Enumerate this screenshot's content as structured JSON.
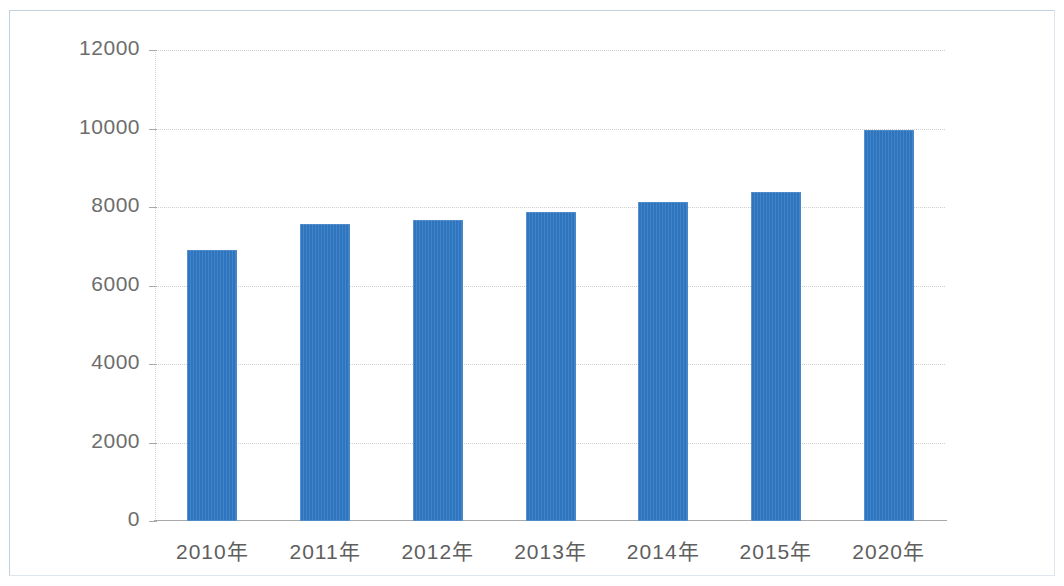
{
  "chart_data": {
    "type": "bar",
    "title": "",
    "subtitle": "",
    "xlabel": "",
    "ylabel": "",
    "categories": [
      "2010年",
      "2011年",
      "2012年",
      "2013年",
      "2014年",
      "2015年",
      "2020年"
    ],
    "values": [
      6900,
      7570,
      7670,
      7880,
      8130,
      8380,
      9950
    ],
    "series": [
      {
        "name": "",
        "values": [
          6900,
          7570,
          7670,
          7880,
          8130,
          8380,
          9950
        ]
      }
    ],
    "ylim": [
      0,
      12000
    ],
    "y_ticks": [
      0,
      2000,
      4000,
      6000,
      8000,
      10000,
      12000
    ],
    "y_tick_labels": [
      "0",
      "2000",
      "4000",
      "6000",
      "8000",
      "10000",
      "12000"
    ],
    "grid": true,
    "grid_axis": "y",
    "grid_style": "dotted",
    "legend": false,
    "legend_position": "none",
    "bar_color": "#2e75c0",
    "axis_color": "#a9a9a9",
    "grid_color": "#cfcfcf",
    "tick_label_color": "#6d6d6d",
    "frame_color": "#c3d0dd",
    "background_color": "#ffffff"
  }
}
